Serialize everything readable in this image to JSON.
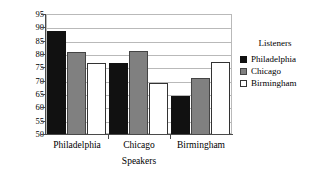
{
  "chart_data": {
    "type": "bar",
    "title": "",
    "xlabel": "Speakers",
    "ylabel": "Percent correct",
    "categories": [
      "Philadelphia",
      "Chicago",
      "Birmingham"
    ],
    "series": [
      {
        "name": "Philadelphia",
        "color": "#111111",
        "values": [
          89.0,
          77.0,
          64.5
        ]
      },
      {
        "name": "Chicago",
        "color": "#808080",
        "values": [
          81.0,
          81.5,
          71.5
        ]
      },
      {
        "name": "Birmingham",
        "color": "#ffffff",
        "values": [
          77.0,
          69.5,
          77.5
        ]
      }
    ],
    "ylim": [
      50,
      95
    ],
    "yticks": [
      50,
      55,
      60,
      65,
      70,
      75,
      80,
      85,
      90,
      95
    ],
    "ytick_labels": [
      "50",
      "55",
      "60",
      "65",
      "70",
      "75",
      "80",
      "85",
      "90",
      "95"
    ],
    "grid": true,
    "legend_position": "right",
    "legend_title": "Listeners"
  },
  "legend": {
    "title": "Listeners",
    "entries": [
      "Philadelphia",
      "Chicago",
      "Birmingham"
    ]
  },
  "axes": {
    "ylabel": "Percent correct",
    "xlabel": "Speakers"
  }
}
